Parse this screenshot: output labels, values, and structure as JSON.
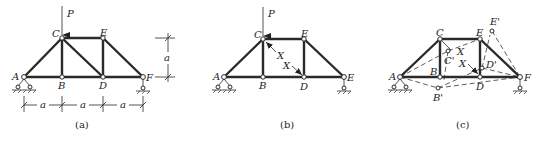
{
  "figure": {
    "panels": [
      {
        "id": "a",
        "caption": "(a)",
        "load_label": "P",
        "nodes": {
          "A": "A",
          "B": "B",
          "C": "C",
          "D": "D",
          "E": "E",
          "F": "F"
        },
        "dimension_label": "a",
        "dimensions_bottom": [
          "a",
          "a",
          "a"
        ],
        "dimension_right": "a"
      },
      {
        "id": "b",
        "caption": "(b)",
        "load_label": "P",
        "nodes": {
          "A": "A",
          "B": "B",
          "C": "C",
          "D": "D",
          "E_top": "E",
          "E_right": "E"
        },
        "redundant_labels": [
          "X",
          "X"
        ]
      },
      {
        "id": "c",
        "caption": "(c)",
        "nodes": {
          "A": "A",
          "B": "B",
          "C": "C",
          "D": "D",
          "E": "E",
          "F": "F"
        },
        "displaced_nodes": {
          "B": "B'",
          "C": "C'",
          "D": "D'",
          "E": "E'"
        },
        "redundant_labels": [
          "X",
          "X"
        ]
      }
    ]
  }
}
